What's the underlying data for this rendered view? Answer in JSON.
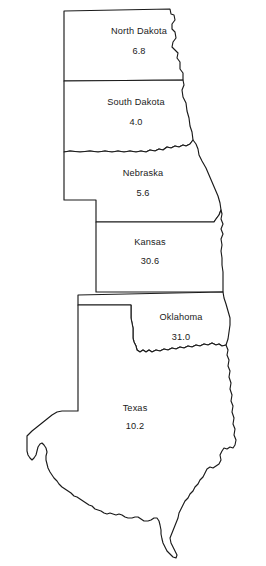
{
  "map": {
    "title": "Great Plains States",
    "type": "choropleth-value-map",
    "width": 266,
    "height": 566,
    "background_color": "#ffffff",
    "outline_color": "#1a1a1a",
    "label_color": "#1a1a1a"
  },
  "chart_data": {
    "type": "map",
    "xlabel": "",
    "ylabel": "",
    "categories": [
      "North Dakota",
      "South Dakota",
      "Nebraska",
      "Kansas",
      "Oklahoma",
      "Texas"
    ],
    "values": [
      6.8,
      4.0,
      5.6,
      30.6,
      31.0,
      10.2
    ],
    "legend": "",
    "grid": false
  },
  "states": [
    {
      "id": "north-dakota",
      "name": "North Dakota",
      "value": "6.8",
      "label_x": 139,
      "label_y": 34,
      "value_x": 139,
      "value_y": 54,
      "path": "M 64 11 L 170 9 L 171 14 L 174 15 L 175 20 L 172 24 L 172 29 L 175 32 L 176 38 L 173 42 L 172 47 L 175 50 L 178 53 L 177 58 L 180 62 L 180 69 L 183 73 L 183 80 L 64 81 Z"
    },
    {
      "id": "south-dakota",
      "name": "South Dakota",
      "value": "4.0",
      "label_x": 136,
      "label_y": 105,
      "value_x": 136,
      "value_y": 125,
      "path": "M 64 81 L 183 80 L 184 85 L 182 90 L 183 97 L 186 103 L 187 111 L 189 118 L 190 126 L 192 132 L 193 140 L 190 144 L 186 146 L 183 145 L 179 147 L 175 146 L 171 148 L 167 147 L 163 150 L 159 149 L 155 151 L 150 150 L 146 152 L 141 151 L 136 152 L 130 151 L 124 152 L 118 151 L 112 152 L 105 151 L 98 152 L 90 151 L 80 152 L 70 151 L 64 152 Z"
    },
    {
      "id": "nebraska",
      "name": "Nebraska",
      "value": "5.6",
      "label_x": 143,
      "label_y": 176,
      "value_x": 143,
      "value_y": 196,
      "path": "M 64 152 L 70 151 L 80 152 L 90 151 L 98 152 L 105 151 L 112 152 L 118 151 L 124 152 L 130 151 L 136 152 L 141 151 L 146 152 L 150 150 L 155 151 L 159 149 L 163 150 L 167 147 L 171 148 L 175 146 L 179 147 L 183 145 L 186 146 L 190 144 L 193 140 L 196 144 L 198 149 L 199 155 L 202 161 L 206 168 L 209 175 L 212 182 L 215 189 L 218 196 L 220 203 L 221 210 L 219 215 L 216 219 L 214 222 L 96 222 L 96 200 L 64 200 Z"
    },
    {
      "id": "kansas",
      "name": "Kansas",
      "value": "30.6",
      "label_x": 150,
      "label_y": 245,
      "value_x": 150,
      "value_y": 264,
      "path": "M 96 222 L 214 222 L 216 219 L 219 215 L 221 210 L 222 214 L 221 219 L 223 224 L 221 229 L 223 234 L 221 239 L 222 245 L 221 251 L 222 258 L 222 265 L 223 272 L 223 280 L 223 288 L 223 292 L 96 292 Z"
    },
    {
      "id": "oklahoma",
      "name": "Oklahoma",
      "value": "31.0",
      "label_x": 181,
      "label_y": 320,
      "value_x": 181,
      "value_y": 340,
      "path": "M 78 295 L 223 292 L 224 298 L 226 304 L 228 311 L 230 318 L 230 325 L 229 332 L 228 339 L 226 345 L 222 346 L 219 344 L 216 345 L 212 343 L 208 345 L 204 344 L 200 346 L 196 345 L 192 347 L 188 346 L 184 348 L 180 347 L 176 349 L 172 348 L 168 350 L 164 349 L 160 351 L 156 350 L 152 352 L 149 350 L 146 352 L 143 350 L 140 352 L 137 350 L 136 346 L 134 342 L 133 338 L 133 333 L 133 328 L 132 323 L 131 318 L 131 313 L 131 308 L 131 305 L 78 305 Z"
    },
    {
      "id": "texas",
      "name": "Texas",
      "value": "10.2",
      "label_x": 135,
      "label_y": 411,
      "value_x": 135,
      "value_y": 429,
      "path": "M 78 305 L 131 305 L 131 308 L 131 313 L 131 318 L 132 323 L 133 328 L 133 333 L 133 338 L 134 342 L 136 346 L 137 350 L 140 352 L 143 350 L 146 352 L 149 350 L 152 352 L 156 350 L 160 351 L 164 349 L 168 350 L 172 348 L 176 349 L 180 347 L 184 348 L 188 346 L 192 347 L 196 345 L 200 346 L 204 344 L 208 345 L 212 343 L 216 345 L 219 344 L 222 346 L 226 345 L 228 350 L 227 355 L 229 360 L 228 366 L 230 371 L 229 377 L 231 383 L 230 389 L 232 395 L 231 401 L 233 406 L 232 412 L 234 418 L 233 424 L 235 429 L 234 435 L 236 440 L 235 445 L 233 448 L 230 447 L 227 449 L 224 448 L 222 451 L 220 455 L 221 460 L 219 464 L 216 466 L 213 468 L 210 467 L 207 469 L 205 473 L 203 477 L 200 480 L 198 484 L 195 487 L 193 491 L 190 494 L 188 498 L 185 501 L 183 505 L 181 509 L 179 513 L 178 518 L 176 523 L 174 528 L 172 533 L 170 538 L 171 543 L 173 547 L 175 551 L 177 555 L 176 558 L 173 557 L 170 554 L 167 551 L 165 547 L 163 543 L 162 539 L 161 534 L 161 530 L 160 525 L 159 521 L 157 518 L 154 518 L 151 520 L 148 521 L 144 521 L 141 519 L 138 517 L 135 517 L 132 518 L 128 518 L 125 517 L 122 515 L 119 514 L 116 515 L 113 514 L 110 513 L 107 514 L 104 513 L 101 511 L 98 510 L 95 509 L 92 506 L 89 505 L 86 503 L 83 501 L 80 499 L 77 497 L 74 496 L 71 493 L 68 491 L 65 489 L 62 487 L 59 484 L 57 481 L 54 478 L 52 475 L 50 472 L 48 468 L 47 464 L 46 460 L 46 456 L 47 452 L 46 448 L 44 445 L 42 443 L 40 444 L 38 447 L 37 451 L 36 455 L 34 458 L 32 460 L 30 458 L 28 455 L 27 451 L 27 446 L 27 441 L 27 436 L 32 431 L 37 427 L 42 423 L 47 419 L 52 415 L 57 412 L 62 411 L 67 411 L 72 411 L 78 411 Z"
    }
  ]
}
